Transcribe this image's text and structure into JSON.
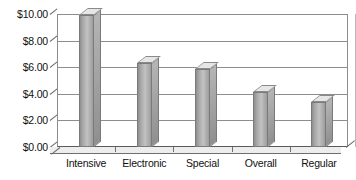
{
  "chart_data": {
    "type": "bar",
    "title": "",
    "subtitle": "",
    "xlabel": "",
    "ylabel": "",
    "categories": [
      "Intensive",
      "Electronic",
      "Special",
      "Overall",
      "Regular"
    ],
    "values": [
      9.9,
      6.35,
      5.85,
      4.1,
      3.35
    ],
    "value_labels": [
      "$9.90",
      "$6.35",
      "$5.85",
      "$4.10",
      "$3.35"
    ],
    "ylim": [
      0,
      10
    ],
    "ytick_values": [
      0,
      2,
      4,
      6,
      8,
      10
    ],
    "ytick_labels": [
      "$0.00",
      "$2.00",
      "$4.00",
      "$6.00",
      "$8.00",
      "$10.00"
    ],
    "grid": true,
    "legend": false,
    "legend_position": "none",
    "style": "3d-grayscale",
    "series": [
      {
        "name": "",
        "values": [
          9.9,
          6.35,
          5.85,
          4.1,
          3.35
        ]
      }
    ],
    "colors": {
      "bar_front": "#a8a8a8",
      "bar_top": "#e6e6e6",
      "bar_side": "#8f8f8f",
      "bar_outline": "#7a7a7a",
      "gridline": "#8d8d8d",
      "axis": "#6f6f6f",
      "plot_background": "#ffffff",
      "text": "#111111"
    }
  }
}
